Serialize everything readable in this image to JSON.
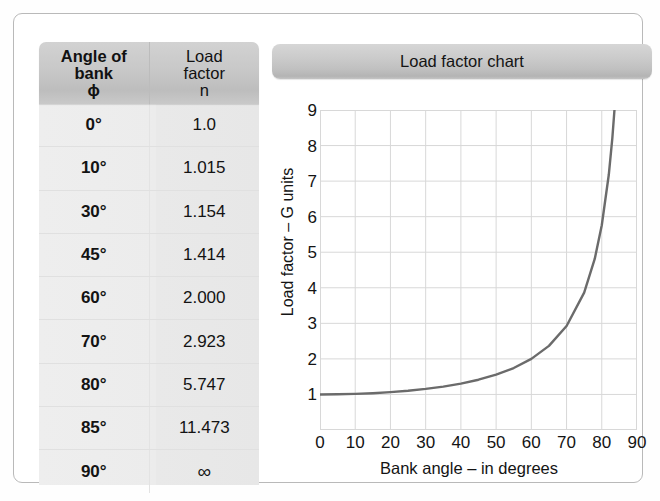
{
  "table": {
    "headers": {
      "angle": {
        "line1": "Angle of",
        "line2": "bank",
        "line3": "ϕ"
      },
      "load": {
        "line1": "Load",
        "line2": "factor",
        "line3": "n"
      }
    },
    "rows": [
      {
        "angle": "0°",
        "load": "1.0"
      },
      {
        "angle": "10°",
        "load": "1.015"
      },
      {
        "angle": "30°",
        "load": "1.154"
      },
      {
        "angle": "45°",
        "load": "1.414"
      },
      {
        "angle": "60°",
        "load": "2.000"
      },
      {
        "angle": "70°",
        "load": "2.923"
      },
      {
        "angle": "80°",
        "load": "5.747"
      },
      {
        "angle": "85°",
        "load": "11.473"
      },
      {
        "angle": "90°",
        "load": "∞"
      }
    ]
  },
  "chart": {
    "title": "Load factor chart"
  },
  "chart_data": {
    "type": "line",
    "title": "Load factor chart",
    "xlabel": "Bank angle – in degrees",
    "ylabel": "Load factor – G units",
    "xlim": [
      0,
      90
    ],
    "ylim": [
      0,
      9
    ],
    "xticks": [
      0,
      10,
      20,
      30,
      40,
      50,
      60,
      70,
      80,
      90
    ],
    "yticks": [
      1,
      2,
      3,
      4,
      5,
      6,
      7,
      8,
      9
    ],
    "grid": true,
    "legend": "none",
    "line_color": "#6b6b6b",
    "series": [
      {
        "name": "Load factor n = 1/cos(ϕ)",
        "x": [
          0,
          5,
          10,
          15,
          20,
          25,
          30,
          35,
          40,
          45,
          50,
          55,
          60,
          65,
          70,
          75,
          78,
          80,
          82,
          83,
          83.6
        ],
        "y": [
          1.0,
          1.004,
          1.015,
          1.035,
          1.064,
          1.103,
          1.155,
          1.221,
          1.305,
          1.414,
          1.556,
          1.743,
          2.0,
          2.366,
          2.924,
          3.864,
          4.81,
          5.759,
          7.185,
          8.206,
          9.0
        ]
      }
    ],
    "annotations": []
  }
}
